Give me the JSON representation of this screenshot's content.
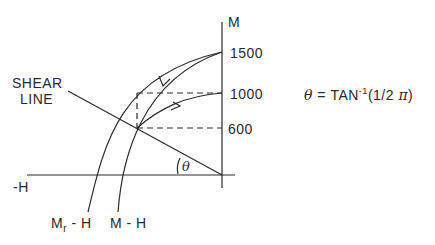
{
  "diagram": {
    "axes": {
      "vertical_label": "M",
      "horizontal_label": "-H",
      "tick_labels": [
        "1500",
        "1000",
        "600"
      ]
    },
    "shear_line_label": [
      "SHEAR",
      "LINE"
    ],
    "angle_label": "θ",
    "formula": {
      "lhs": "θ",
      "eq": " = TAN",
      "sup": "-1",
      "arg_open": "(1/2 ",
      "pi": "π",
      "arg_close": ")"
    },
    "curve_labels": {
      "mr_h": {
        "main": "M",
        "sub": "r",
        "rest": " - H"
      },
      "m_h": "M - H"
    },
    "colors": {
      "line": "#2a2a2a",
      "background": "#ffffff"
    }
  }
}
